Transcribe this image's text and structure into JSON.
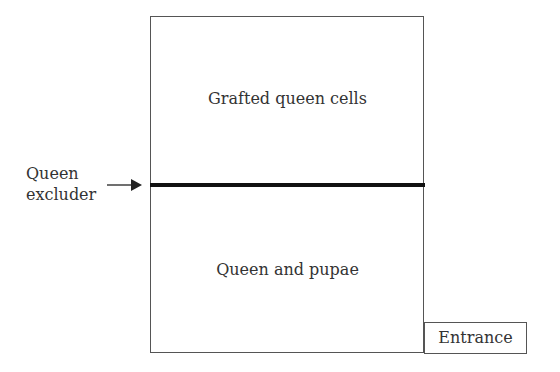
{
  "diagram": {
    "upper_chamber": {
      "label": "Grafted queen cells"
    },
    "lower_chamber": {
      "label": "Queen and pupae"
    },
    "divider": {
      "label_line1": "Queen",
      "label_line2": "excluder"
    },
    "entrance": {
      "label": "Entrance"
    }
  }
}
